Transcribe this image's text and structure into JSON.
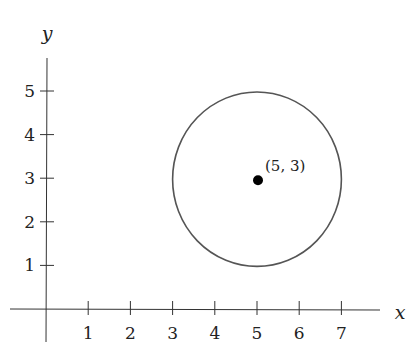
{
  "chart_data": {
    "type": "scatter",
    "title": "",
    "xlabel": "x",
    "ylabel": "y",
    "xlim": [
      -0.9,
      8.4
    ],
    "ylim": [
      -0.9,
      5.8
    ],
    "x_ticks": [
      1,
      2,
      3,
      4,
      5,
      6,
      7
    ],
    "y_ticks": [
      1,
      2,
      3,
      4,
      5
    ],
    "grid": false,
    "legend": null,
    "points": [
      {
        "x": 5,
        "y": 3,
        "label": "(5, 3)"
      }
    ],
    "shapes": [
      {
        "type": "circle",
        "center": [
          5,
          3
        ],
        "radius": 2
      }
    ]
  },
  "labels": {
    "x_axis": "x",
    "y_axis": "y",
    "center_point": "(5, 3)",
    "x_ticks": [
      "1",
      "2",
      "3",
      "4",
      "5",
      "6",
      "7"
    ],
    "y_ticks": [
      "1",
      "2",
      "3",
      "4",
      "5"
    ]
  },
  "colors": {
    "axis": "#333333",
    "circle": "#555555",
    "point": "#000000"
  }
}
